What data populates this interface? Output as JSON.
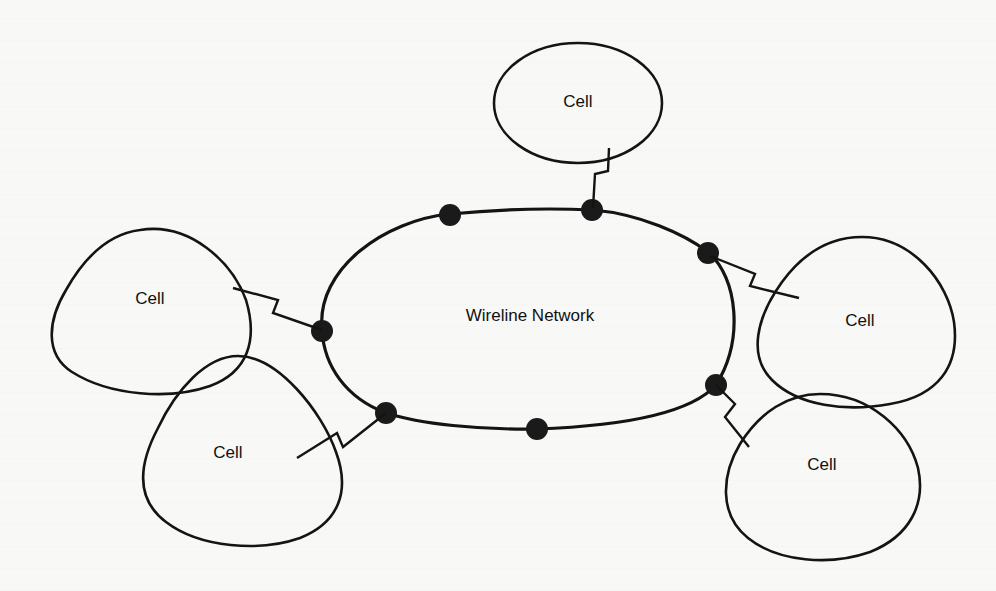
{
  "diagram": {
    "title": "",
    "network": {
      "label": "Wireline Network"
    },
    "cells": [
      {
        "id": "top",
        "label": "Cell"
      },
      {
        "id": "upper-left",
        "label": "Cell"
      },
      {
        "id": "lower-left",
        "label": "Cell"
      },
      {
        "id": "upper-right",
        "label": "Cell"
      },
      {
        "id": "lower-right",
        "label": "Cell"
      }
    ],
    "nodes_count": 7,
    "links": [
      {
        "from": "top",
        "to": "network-node-2",
        "style": "wireless-zigzag"
      },
      {
        "from": "upper-left",
        "to": "network-node-4",
        "style": "wireless-zigzag"
      },
      {
        "from": "lower-left",
        "to": "network-node-6",
        "style": "wireless-zigzag"
      },
      {
        "from": "upper-right",
        "to": "network-node-3",
        "style": "wireless-zigzag"
      },
      {
        "from": "lower-right",
        "to": "network-node-5",
        "style": "wireless-zigzag"
      }
    ],
    "colors": {
      "line": "#141414",
      "node": "#1a1a1a",
      "background": "#f8f8f6"
    }
  }
}
